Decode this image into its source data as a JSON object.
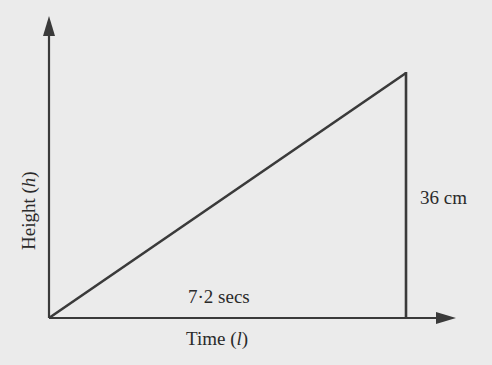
{
  "diagram": {
    "type": "right-triangle-graph",
    "y_axis_label": {
      "text": "Height (",
      "var": "h",
      "close": ")"
    },
    "x_axis_label": {
      "text": "Time (",
      "var": "l",
      "close": ")"
    },
    "base_label": "7·2 secs",
    "height_label": "36 cm",
    "colors": {
      "background": "#ebebeb",
      "line": "#3a3a3a",
      "text": "#2a2a2a"
    }
  }
}
